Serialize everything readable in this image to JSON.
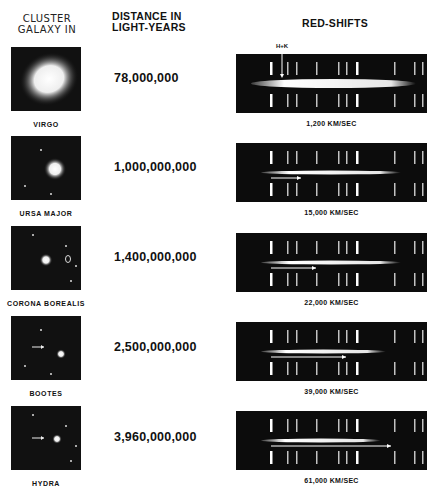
{
  "headers": {
    "cluster_line1": "CLUSTER",
    "cluster_line2": "GALAXY IN",
    "distance_line1": "DISTANCE IN",
    "distance_line2": "LIGHT-YEARS",
    "redshifts": "RED-SHIFTS"
  },
  "hk_label": "H+K",
  "rows": [
    {
      "name": "VIRGO",
      "distance": "78,000,000",
      "velocity": "1,200 KM/SEC",
      "shift_fraction": 0.02
    },
    {
      "name": "URSA MAJOR",
      "distance": "1,000,000,000",
      "velocity": "15,000 KM/SEC",
      "shift_fraction": 0.2
    },
    {
      "name": "CORONA BOREALIS",
      "distance": "1,400,000,000",
      "velocity": "22,000 KM/SEC",
      "shift_fraction": 0.3
    },
    {
      "name": "BOOTES",
      "distance": "2,500,000,000",
      "velocity": "39,000 KM/SEC",
      "shift_fraction": 0.5
    },
    {
      "name": "HYDRA",
      "distance": "3,960,000,000",
      "velocity": "61,000 KM/SEC",
      "shift_fraction": 0.8
    }
  ]
}
